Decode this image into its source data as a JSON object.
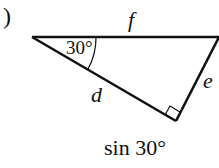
{
  "diagram": {
    "part_label": ")",
    "side_labels": {
      "hypotenuse": "f",
      "adjacent": "d",
      "opposite": "e"
    },
    "angle_label": "30°",
    "caption": "sin 30°",
    "right_angle_marker": true,
    "colors": {
      "stroke": "#111111",
      "background": "#ffffff"
    }
  }
}
